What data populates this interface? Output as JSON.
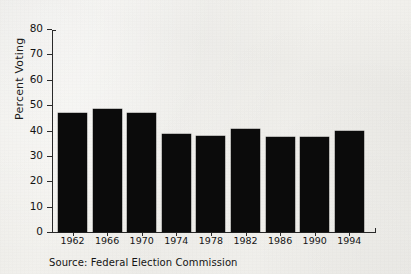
{
  "chart_data": {
    "type": "bar",
    "title": "",
    "subtitle": "",
    "xlabel": "",
    "ylabel": "Percent Voting",
    "categories": [
      "1962",
      "1966",
      "1970",
      "1974",
      "1978",
      "1982",
      "1986",
      "1990",
      "1994"
    ],
    "values": [
      47,
      48.5,
      47,
      38.8,
      37.8,
      40.5,
      37.5,
      37.5,
      40
    ],
    "ylim": [
      0,
      80
    ],
    "ytick_values": [
      0,
      10,
      20,
      30,
      40,
      50,
      60,
      70,
      80
    ],
    "ytick_labels": [
      "0",
      "10",
      "20",
      "30",
      "40",
      "50",
      "60",
      "70",
      "80"
    ],
    "grid": false,
    "legend": "none",
    "bar_color": "#0b0b0b",
    "axis_color": "#2a2a2a",
    "background_color": "#f3f2ee",
    "series": [
      {
        "name": "Percent Voting",
        "values": [
          47,
          48.5,
          47,
          38.8,
          37.8,
          40.5,
          37.5,
          37.5,
          40
        ]
      }
    ]
  },
  "figure": {
    "source_note": "Source: Federal Election Commission"
  }
}
